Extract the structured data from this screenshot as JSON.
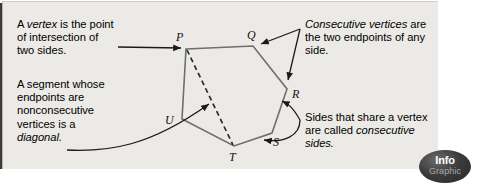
{
  "panel": {
    "background_color": "#eceae6",
    "border_color": "#b9b7b3"
  },
  "callouts": {
    "vertex": {
      "text_before": "A ",
      "term": "vertex",
      "text_after": " is the point\nof intersection of\ntwo sides."
    },
    "diagonal": {
      "text_before": "A segment whose\nendpoints are\nnonconsecutive\nvertices is a\n",
      "term": "diagonal.",
      "text_after": ""
    },
    "consecutive_vertices": {
      "term": "Consecutive vertices",
      "text_after": " are\nthe two endpoints of any\nside."
    },
    "consecutive_sides": {
      "text_before": "Sides that share a vertex\nare called ",
      "term": "consecutive\nsides.",
      "text_after": ""
    }
  },
  "diagram": {
    "shape_name": "hexagon",
    "stroke_color": "#6e6e6e",
    "diagonal_style": "dashed",
    "vertices": [
      {
        "label": "P",
        "x": 186,
        "y": 49,
        "label_x": 176,
        "label_y": 41
      },
      {
        "label": "Q",
        "x": 253,
        "y": 46,
        "label_x": 247,
        "label_y": 39
      },
      {
        "label": "R",
        "x": 287,
        "y": 89,
        "label_x": 292,
        "label_y": 98
      },
      {
        "label": "S",
        "x": 272,
        "y": 133,
        "label_x": 273,
        "label_y": 146
      },
      {
        "label": "T",
        "x": 234,
        "y": 146,
        "label_x": 229,
        "label_y": 160
      },
      {
        "label": "U",
        "x": 182,
        "y": 119,
        "label_x": 168,
        "label_y": 124
      }
    ],
    "diagonals": [
      {
        "from": "P",
        "to": "T"
      }
    ]
  },
  "badge": {
    "line1": "Info",
    "line2": "Graphic",
    "fill_color": "#2b2b2b",
    "text_color": "#ffffff"
  }
}
